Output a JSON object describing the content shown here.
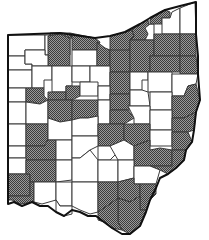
{
  "map": {
    "title": "Ohio county map",
    "legend": {
      "shaded_label": "Shaded county",
      "unshaded_label": "Unshaded county"
    },
    "colors": {
      "shaded_dark": "#4a4a4a",
      "shaded_light": "#9a9a9a",
      "unshaded": "#ffffff",
      "border": "#3a3a3a",
      "state_outline": "#111111"
    },
    "counties": [
      {
        "id": "c01",
        "shaded": false,
        "points": "8,35 45,35 45,50 25,50 25,56 8,56"
      },
      {
        "id": "c02",
        "shaded": false,
        "points": "45,35 50,35 50,40 70,38 70,55 45,55 45,50"
      },
      {
        "id": "c03",
        "shaded": true,
        "points": "50,33 70,33 72,38 70,38 50,40"
      },
      {
        "id": "c04",
        "shaded": true,
        "points": "48,36 60,34 70,38 70,66 48,66 48,55"
      },
      {
        "id": "c05",
        "shaded": true,
        "points": "70,33 95,38 100,42 97,50 90,50 72,50 72,38"
      },
      {
        "id": "c06",
        "shaded": false,
        "points": "72,50 97,50 97,66 72,66"
      },
      {
        "id": "c07",
        "shaded": false,
        "points": "8,56 25,56 25,64 32,64 32,70 8,70"
      },
      {
        "id": "c08",
        "shaded": false,
        "points": "25,50 45,50 45,55 48,55 48,66 32,66 32,64 25,64"
      },
      {
        "id": "c09",
        "shaded": true,
        "points": "97,42 105,48 110,50 110,66 97,66 97,50"
      },
      {
        "id": "c10",
        "shaded": true,
        "points": "110,36 125,32 132,30 134,36 130,40 130,50 118,52 110,50"
      },
      {
        "id": "c11",
        "shaded": true,
        "points": "132,30 140,24 148,20 150,32 145,40 130,40 134,36"
      },
      {
        "id": "c12",
        "shaded": false,
        "points": "145,28 150,24 154,24 154,40 145,40 148,34"
      },
      {
        "id": "c13",
        "shaded": true,
        "points": "150,20 160,12 165,10 170,12 170,18 162,18 162,24 154,24 150,24"
      },
      {
        "id": "c14",
        "shaded": false,
        "points": "162,18 170,18 172,12 180,8 180,34 162,34 162,24"
      },
      {
        "id": "c15",
        "shaded": false,
        "points": "180,8 195,2 196,34 180,34"
      },
      {
        "id": "c16",
        "shaded": true,
        "points": "110,50 130,50 130,72 110,72 110,66"
      },
      {
        "id": "c17",
        "shaded": true,
        "points": "130,40 154,40 154,56 150,56 150,72 130,72"
      },
      {
        "id": "c18",
        "shaded": true,
        "points": "154,34 180,34 180,56 154,56"
      },
      {
        "id": "c19",
        "shaded": true,
        "points": "180,34 196,34 196,56 180,56"
      },
      {
        "id": "c20",
        "shaded": true,
        "points": "150,56 180,56 180,72 150,72"
      },
      {
        "id": "c21",
        "shaded": true,
        "points": "180,56 196,56 198,74 180,74"
      },
      {
        "id": "c22",
        "shaded": false,
        "points": "8,70 32,70 32,88 8,88"
      },
      {
        "id": "c23",
        "shaded": false,
        "points": "32,66 52,66 52,80 44,80 44,88 32,88"
      },
      {
        "id": "c24",
        "shaded": false,
        "points": "52,66 72,66 72,86 66,86 66,92 52,92 52,80"
      },
      {
        "id": "c25",
        "shaded": false,
        "points": "72,66 90,66 90,82 72,82"
      },
      {
        "id": "c26",
        "shaded": false,
        "points": "90,66 110,66 110,86 90,86"
      },
      {
        "id": "c27",
        "shaded": true,
        "points": "110,72 130,72 130,94 120,94 110,94"
      },
      {
        "id": "c28",
        "shaded": false,
        "points": "130,72 148,72 148,80 142,80 142,90 130,90"
      },
      {
        "id": "c29",
        "shaded": false,
        "points": "148,72 172,72 172,92 148,92 148,80"
      },
      {
        "id": "c30",
        "shaded": false,
        "points": "172,74 198,74 196,84 188,86 184,96 172,96"
      },
      {
        "id": "c31",
        "shaded": false,
        "points": "8,88 26,88 26,102 8,102"
      },
      {
        "id": "c32",
        "shaded": true,
        "points": "26,88 44,88 44,96 48,100 40,104 32,102 26,102"
      },
      {
        "id": "c33",
        "shaded": true,
        "points": "48,92 66,92 66,100 48,100"
      },
      {
        "id": "c34",
        "shaded": true,
        "points": "66,86 80,86 80,96 72,100 66,100"
      },
      {
        "id": "c35",
        "shaded": false,
        "points": "80,82 98,82 98,96 80,96"
      },
      {
        "id": "c36",
        "shaded": false,
        "points": "98,86 110,86 110,100 98,100"
      },
      {
        "id": "c37",
        "shaded": true,
        "points": "110,94 130,94 130,110 110,110"
      },
      {
        "id": "c38",
        "shaded": false,
        "points": "130,90 142,90 148,92 150,106 130,106"
      },
      {
        "id": "c39",
        "shaded": false,
        "points": "150,92 172,92 172,110 150,110"
      },
      {
        "id": "c40",
        "shaded": true,
        "points": "172,96 184,96 188,86 196,84 200,100 196,112 184,118 172,118"
      },
      {
        "id": "c41",
        "shaded": false,
        "points": "8,102 26,102 26,124 8,124"
      },
      {
        "id": "c42",
        "shaded": false,
        "points": "26,102 40,104 48,100 48,124 26,124"
      },
      {
        "id": "c43",
        "shaded": true,
        "points": "48,100 72,100 72,120 60,122 48,118"
      },
      {
        "id": "c44",
        "shaded": true,
        "points": "72,100 98,100 98,116 88,118 80,118 72,120"
      },
      {
        "id": "c45",
        "shaded": false,
        "points": "98,100 110,100 110,124 98,124"
      },
      {
        "id": "c46",
        "shaded": true,
        "points": "110,110 128,110 134,118 124,124 110,124"
      },
      {
        "id": "c47",
        "shaded": false,
        "points": "128,106 150,106 150,124 134,124 134,118"
      },
      {
        "id": "c48",
        "shaded": false,
        "points": "150,110 172,110 172,130 150,130"
      },
      {
        "id": "c49",
        "shaded": true,
        "points": "172,118 184,118 196,112 194,130 188,132 172,132"
      },
      {
        "id": "c50",
        "shaded": false,
        "points": "8,124 26,124 26,146 8,146"
      },
      {
        "id": "c51",
        "shaded": true,
        "points": "26,124 48,124 48,140 44,146 26,146"
      },
      {
        "id": "c52",
        "shaded": false,
        "points": "48,118 60,122 72,120 72,140 48,140"
      },
      {
        "id": "c53",
        "shaded": false,
        "points": "72,120 80,118 88,118 98,116 98,136 72,136"
      },
      {
        "id": "c54",
        "shaded": true,
        "points": "98,124 124,124 124,140 110,146 98,146"
      },
      {
        "id": "c55",
        "shaded": true,
        "points": "124,124 150,124 150,140 134,146 124,140"
      },
      {
        "id": "c56",
        "shaded": false,
        "points": "150,130 172,130 172,146 150,146"
      },
      {
        "id": "c57",
        "shaded": true,
        "points": "172,132 188,132 192,142 186,150 172,150"
      },
      {
        "id": "c58",
        "shaded": false,
        "points": "8,146 26,146 26,158 8,158"
      },
      {
        "id": "c59",
        "shaded": true,
        "points": "26,146 44,146 48,140 56,140 56,160 26,160"
      },
      {
        "id": "c60",
        "shaded": false,
        "points": "56,140 72,140 72,160 56,160"
      },
      {
        "id": "c61",
        "shaded": false,
        "points": "72,136 98,136 98,146 90,150 80,158 72,158"
      },
      {
        "id": "c62",
        "shaded": false,
        "points": "98,146 110,146 118,152 110,160 98,160"
      },
      {
        "id": "c63",
        "shaded": false,
        "points": "110,146 124,140 134,146 134,160 118,160"
      },
      {
        "id": "c64",
        "shaded": true,
        "points": "134,146 150,140 150,150 160,148 172,150 172,166 150,166 134,166"
      },
      {
        "id": "c65",
        "shaded": true,
        "points": "172,150 186,150 184,160 176,168 168,174 160,170 150,166 172,166"
      },
      {
        "id": "c66",
        "shaded": false,
        "points": "8,158 26,158 26,174 8,174"
      },
      {
        "id": "c67",
        "shaded": true,
        "points": "8,174 30,174 30,196 8,196"
      },
      {
        "id": "c68",
        "shaded": true,
        "points": "26,160 56,160 56,182 30,182 30,174 26,174"
      },
      {
        "id": "c69",
        "shaded": false,
        "points": "56,160 72,160 72,180 56,182"
      },
      {
        "id": "c70",
        "shaded": false,
        "points": "72,158 80,158 90,150 98,160 98,182 72,182 72,180"
      },
      {
        "id": "c71",
        "shaded": false,
        "points": "98,160 118,160 118,182 98,182"
      },
      {
        "id": "c72",
        "shaded": false,
        "points": "118,160 134,160 134,178 118,182"
      },
      {
        "id": "c73",
        "shaded": false,
        "points": "134,166 150,166 160,170 156,184 134,184 134,178"
      },
      {
        "id": "c74",
        "shaded": true,
        "points": "8,196 30,196 30,182 34,182 34,202 20,204 12,200 8,200"
      },
      {
        "id": "c75",
        "shaded": false,
        "points": "34,182 56,182 56,200 42,204 34,202"
      },
      {
        "id": "c76",
        "shaded": false,
        "points": "56,182 72,182 72,206 60,206 56,200"
      },
      {
        "id": "c77",
        "shaded": false,
        "points": "72,182 98,182 98,212 90,214 80,210 72,206"
      },
      {
        "id": "c78",
        "shaded": true,
        "points": "98,182 118,182 118,198 110,204 98,212"
      },
      {
        "id": "c79",
        "shaded": true,
        "points": "118,182 134,178 134,184 140,184 140,196 130,202 118,198"
      },
      {
        "id": "c80",
        "shaded": true,
        "points": "140,184 156,184 156,194 150,200 146,210 140,210 140,196"
      },
      {
        "id": "c81",
        "shaded": false,
        "points": "56,200 60,206 72,206 72,214 64,216 56,212"
      },
      {
        "id": "c82",
        "shaded": true,
        "points": "118,198 130,202 140,196 140,210 146,210 140,226 130,234 122,230 118,222"
      },
      {
        "id": "c83",
        "shaded": true,
        "points": "98,212 110,204 118,198 118,222 122,230 112,228 104,222 98,220"
      }
    ],
    "state_outline": "8,35 60,33 95,38 110,36 125,32 140,24 150,18 165,10 180,6 196,2 196,34 198,56 198,74 200,100 196,112 194,130 192,142 186,150 184,160 176,168 168,174 160,178 156,188 150,200 146,212 140,226 130,234 122,234 112,228 104,222 96,216 88,216 80,212 72,210 64,216 56,212 48,206 40,206 32,202 22,206 14,202 8,204"
  }
}
